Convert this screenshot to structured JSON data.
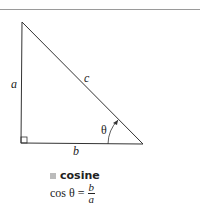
{
  "diagram": {
    "labels": {
      "a": "a",
      "b": "b",
      "c": "c",
      "theta": "θ"
    },
    "colors": {
      "line": "#333333",
      "caption_square": "#bbbbbb"
    }
  },
  "caption": {
    "title": "cosine",
    "formula_left": "cos θ =",
    "numerator": "b",
    "denominator": "a"
  }
}
